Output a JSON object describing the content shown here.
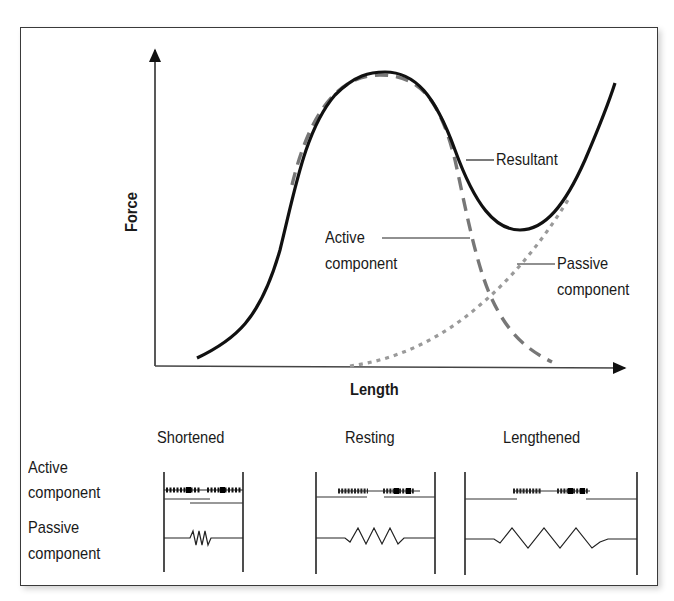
{
  "diagram": {
    "type": "length-tension-curve",
    "axes": {
      "y_label": "Force",
      "x_label": "Length"
    },
    "curve_labels": {
      "resultant": "Resultant",
      "active_line1": "Active",
      "active_line2": "component",
      "passive_line1": "Passive",
      "passive_line2": "component"
    },
    "curves": [
      {
        "name": "Resultant",
        "style": "solid",
        "color": "#111111"
      },
      {
        "name": "Active component",
        "style": "dashed",
        "color": "#7a7a7a"
      },
      {
        "name": "Passive component",
        "style": "dotted",
        "color": "#9a9a9a"
      }
    ],
    "sarcomere_states": {
      "columns": [
        "Shortened",
        "Resting",
        "Lengthened"
      ],
      "rows": [
        {
          "line1": "Active",
          "line2": "component"
        },
        {
          "line1": "Passive",
          "line2": "component"
        }
      ]
    }
  }
}
